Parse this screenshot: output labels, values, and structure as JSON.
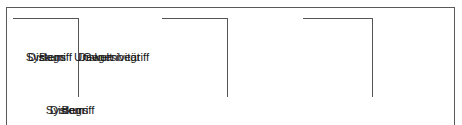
{
  "figure": {
    "name": "bracket-diagram",
    "line_color": "#555555",
    "frame_color": "#5a5a5a",
    "text_color": "#1c1c1c",
    "background": "#ffffff"
  },
  "groups": [
    {
      "id": "begriff",
      "left_term": "Begriff",
      "right_term": "Gegenbegriff",
      "summary": "Begriff"
    },
    {
      "id": "system",
      "left_term": "System",
      "right_term": "Umwelt",
      "summary": "System"
    },
    {
      "id": "diskurs",
      "left_term": "Diskurs",
      "right_term": "Diskursivität",
      "summary": "Diskurs"
    }
  ]
}
